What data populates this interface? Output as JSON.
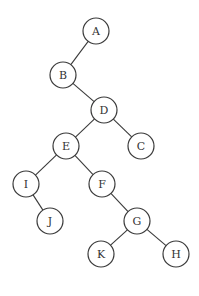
{
  "diagram": {
    "type": "binary-tree",
    "node_radius": 13,
    "colors": {
      "stroke": "#3a3a3a",
      "fill": "#ffffff",
      "text": "#333333",
      "background": "#ffffff"
    },
    "nodes": [
      {
        "id": "A",
        "label": "A",
        "x": 96,
        "y": 31
      },
      {
        "id": "B",
        "label": "B",
        "x": 63,
        "y": 75
      },
      {
        "id": "D",
        "label": "D",
        "x": 104,
        "y": 110
      },
      {
        "id": "E",
        "label": "E",
        "x": 66,
        "y": 146
      },
      {
        "id": "C",
        "label": "C",
        "x": 141,
        "y": 146
      },
      {
        "id": "I",
        "label": "I",
        "x": 26,
        "y": 184
      },
      {
        "id": "F",
        "label": "F",
        "x": 102,
        "y": 184
      },
      {
        "id": "J",
        "label": "J",
        "x": 50,
        "y": 221
      },
      {
        "id": "G",
        "label": "G",
        "x": 137,
        "y": 221
      },
      {
        "id": "K",
        "label": "K",
        "x": 101,
        "y": 254
      },
      {
        "id": "H",
        "label": "H",
        "x": 176,
        "y": 254
      }
    ],
    "edges": [
      {
        "from": "A",
        "to": "B"
      },
      {
        "from": "B",
        "to": "D"
      },
      {
        "from": "D",
        "to": "E"
      },
      {
        "from": "D",
        "to": "C"
      },
      {
        "from": "E",
        "to": "I"
      },
      {
        "from": "E",
        "to": "F"
      },
      {
        "from": "I",
        "to": "J"
      },
      {
        "from": "F",
        "to": "G"
      },
      {
        "from": "G",
        "to": "K"
      },
      {
        "from": "G",
        "to": "H"
      }
    ]
  }
}
